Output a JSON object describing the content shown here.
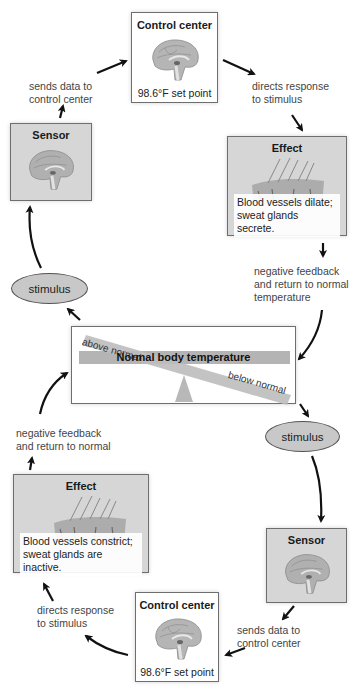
{
  "diagram": {
    "top_loop": {
      "control_center": {
        "title": "Control center",
        "caption": "98.6°F set point"
      },
      "sensor": {
        "title": "Sensor"
      },
      "effect": {
        "title": "Effect",
        "caption_line1": "Blood vessels dilate;",
        "caption_line2": "sweat glands secrete."
      },
      "stimulus": "stimulus",
      "label_sends": {
        "line1": "sends data to",
        "line2": "control center"
      },
      "label_directs": {
        "line1": "directs response",
        "line2": "to stimulus"
      },
      "label_feedback": {
        "line1": "negative feedback",
        "line2": "and return to normal",
        "line3": "temperature"
      }
    },
    "balance": {
      "center_label": "Normal body temperature",
      "above_label": "above normal",
      "below_label": "below normal"
    },
    "bottom_loop": {
      "stimulus": "stimulus",
      "sensor": {
        "title": "Sensor"
      },
      "control_center": {
        "title": "Control center",
        "caption": "98.6°F set point"
      },
      "effect": {
        "title": "Effect",
        "caption_line1": "Blood vessels constrict;",
        "caption_line2": "sweat glands are inactive."
      },
      "label_sends": {
        "line1": "sends data to",
        "line2": "control center"
      },
      "label_directs": {
        "line1": "directs response",
        "line2": "to stimulus"
      },
      "label_feedback": {
        "line1": "negative feedback",
        "line2": "and return to normal"
      }
    },
    "colors": {
      "box_gray": "#d6d6d6",
      "ellipse_gray": "#c8c8c8",
      "bar_gray": "#b4b4b4",
      "arrow": "#111111",
      "brain": "#a9a9a9"
    }
  }
}
